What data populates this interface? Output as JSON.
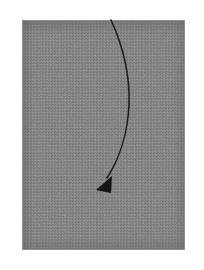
{
  "figure": {
    "kind": "scanned-diagram",
    "caption": "",
    "canvas": {
      "width": 204,
      "height": 270,
      "background_color": "#ffffff"
    },
    "panel": {
      "name": "gray-shaded-region",
      "x": 22,
      "y": 20,
      "width": 163,
      "height": 230,
      "fill_color": "#7e7e7e",
      "edge_shadow_color": "#6d6d6d",
      "texture": "halftone-noise",
      "border_color": "#b9b9b9"
    },
    "reference_line": {
      "name": "dashed-midline",
      "orientation": "horizontal",
      "y": 103,
      "x_start": 22,
      "x_end": 185,
      "color": "#3d3d3d",
      "style": "dashed",
      "dash_pattern": "3 3",
      "stroke_width": 1
    },
    "trajectory": {
      "name": "curved-arrow-path",
      "color": "#1f1f1f",
      "stroke_width": 1.6,
      "start_point": [
        111,
        20
      ],
      "end_point": [
        106,
        180
      ],
      "bulge_direction": "right",
      "max_x": 130,
      "crossing_y": 103,
      "path_d": "M 111 20 C 122 44, 130 74, 129 104 C 128 131, 120 158, 107 178"
    },
    "arrowhead": {
      "name": "arrow-tip",
      "shape": "solid-triangle",
      "direction": "down-left",
      "center": [
        105,
        185
      ],
      "width": 16,
      "height": 15,
      "fill_color": "#121212",
      "points": "112,176 96,190 111,193"
    },
    "labels": []
  }
}
